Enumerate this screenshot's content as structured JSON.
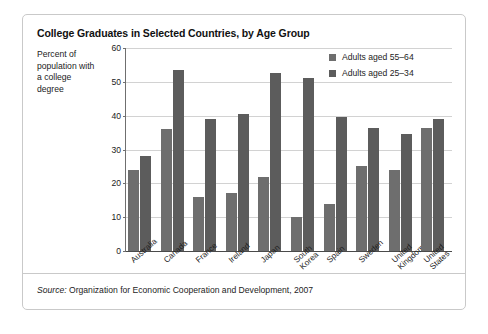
{
  "chart_data": {
    "type": "bar",
    "title": "College Graduates in Selected Countries, by Age Group",
    "xlabel": "",
    "ylabel": "Percent of population with a college degree",
    "ylim": [
      0,
      60
    ],
    "yticks": [
      0,
      10,
      20,
      30,
      40,
      50,
      60
    ],
    "grid": true,
    "legend_position": "top-right",
    "categories": [
      "Australia",
      "Canada",
      "France",
      "Ireland",
      "Japan",
      "South Korea",
      "Spain",
      "Sweden",
      "United Kingdom",
      "United States"
    ],
    "category_lines": [
      [
        "Australia"
      ],
      [
        "Canada"
      ],
      [
        "France"
      ],
      [
        "Ireland"
      ],
      [
        "Japan"
      ],
      [
        "South",
        "Korea"
      ],
      [
        "Spain"
      ],
      [
        "Sweden"
      ],
      [
        "United",
        "Kingdom"
      ],
      [
        "United",
        "States"
      ]
    ],
    "series": [
      {
        "name": "Adults aged 55–64",
        "color": "#6e6e6e",
        "values": [
          24,
          36,
          16,
          17,
          22,
          10,
          14,
          25,
          24,
          36.5
        ]
      },
      {
        "name": "Adults aged 25–34",
        "color": "#5c5c5c",
        "values": [
          28,
          53.5,
          39,
          40.5,
          52.5,
          51,
          39.5,
          36.5,
          34.5,
          39
        ]
      }
    ],
    "source_prefix": "Source:",
    "source_text": " Organization for Economic Cooperation and Development, 2007"
  }
}
